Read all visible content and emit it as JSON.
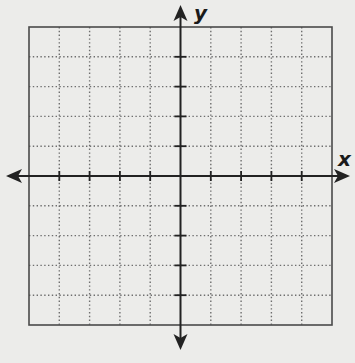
{
  "diagram": {
    "type": "coordinate-plane",
    "grid": {
      "cells_x": 10,
      "cells_y": 10,
      "x_range": [
        -5,
        5
      ],
      "y_range": [
        -5,
        5
      ],
      "line_style": "dotted",
      "border": "solid"
    },
    "axes": {
      "x_label": "x",
      "y_label": "y",
      "arrows": "both-ends",
      "tick_marks": true
    },
    "colors": {
      "background": "#ececea",
      "axis": "#222222",
      "grid": "#6e6e6e",
      "border": "#4a4a4a"
    }
  }
}
